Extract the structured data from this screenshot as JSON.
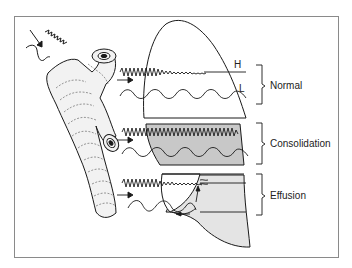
{
  "figure": {
    "wave_labels": {
      "high": "H",
      "low": "L"
    },
    "regions": [
      {
        "id": "normal",
        "label": "Normal"
      },
      {
        "id": "consolidation",
        "label": "Consolidation"
      },
      {
        "id": "effusion",
        "label": "Effusion"
      }
    ],
    "colors": {
      "stroke": "#1a1a1a",
      "consolidation_fill": "#c8c8c8",
      "effusion_fill": "#e4e4e4",
      "airway_fill": "#f2f2f2",
      "frame": "#8a8a8a"
    }
  }
}
